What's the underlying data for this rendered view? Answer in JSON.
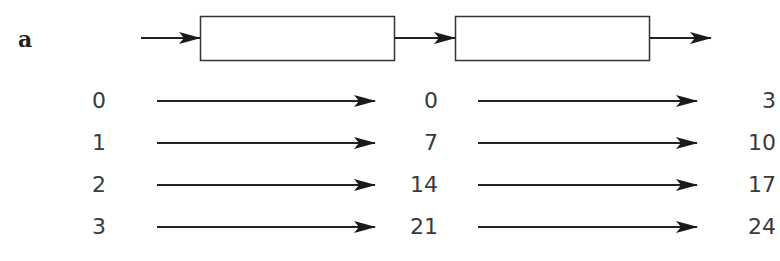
{
  "panel": {
    "label": "a"
  },
  "pipeline": {
    "stages": [
      {
        "name": "stage-1",
        "label": ""
      },
      {
        "name": "stage-2",
        "label": ""
      }
    ]
  },
  "mapping": {
    "columns": [
      "input",
      "after_stage_1",
      "after_stage_2"
    ],
    "rows": [
      {
        "input": "0",
        "mid": "0",
        "out": "3"
      },
      {
        "input": "1",
        "mid": "7",
        "out": "10"
      },
      {
        "input": "2",
        "mid": "14",
        "out": "17"
      },
      {
        "input": "3",
        "mid": "21",
        "out": "24"
      }
    ]
  },
  "colors": {
    "stroke": "#222222",
    "text": "#3a3a3a"
  }
}
